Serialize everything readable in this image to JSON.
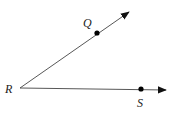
{
  "diagram": {
    "type": "angle",
    "vertex": {
      "label": "R",
      "x": 20,
      "y": 88
    },
    "rays": [
      {
        "name": "ray-RQ",
        "point": {
          "label": "Q",
          "x": 97,
          "y": 33
        },
        "tip": {
          "x": 129,
          "y": 12
        }
      },
      {
        "name": "ray-RS",
        "point": {
          "label": "S",
          "x": 141,
          "y": 89
        },
        "tip": {
          "x": 166,
          "y": 90
        }
      }
    ],
    "colors": {
      "line": "#333333",
      "point": "#000000"
    }
  },
  "labels": {
    "R": "R",
    "Q": "Q",
    "S": "S"
  }
}
